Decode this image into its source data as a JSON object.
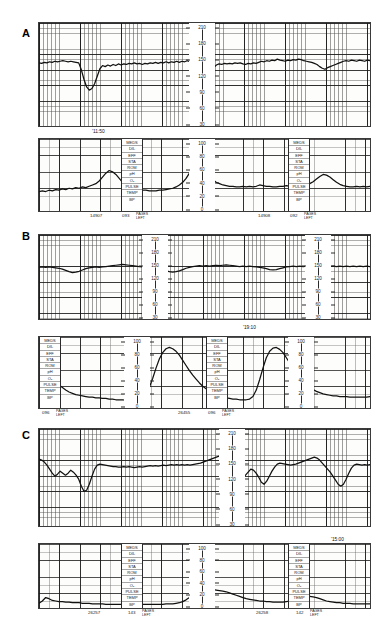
{
  "document": {
    "type": "cardiotocography-strips",
    "panel_count": 3
  },
  "panels": [
    {
      "letter": "A",
      "timestamp": "'11:50",
      "fhr": {
        "ylabel": "FHR (bpm)",
        "ticks": [
          "210",
          "180",
          "150",
          "120",
          "90",
          "60",
          "30"
        ],
        "ymin": 30,
        "ymax": 210
      },
      "toco": {
        "ylabel": "UA (mmHg)",
        "ticks": [
          "100",
          "80",
          "60",
          "40",
          "20",
          "0"
        ],
        "ymin": 0,
        "ymax": 100,
        "annotations": [
          "MEDS",
          "DIL",
          "EFF",
          "STA",
          "ROM",
          "pH",
          "O₂",
          "PULSE",
          "TEMP",
          "BP"
        ]
      },
      "footers": [
        {
          "id": "14907",
          "count": "093",
          "pages": "PAGES",
          "left": "LEFT"
        },
        {
          "id": "14908",
          "count": "092",
          "pages": "PAGES",
          "left": "LEFT"
        }
      ]
    },
    {
      "letter": "B",
      "timestamp": "'19:10",
      "fhr": {
        "ylabel": "FHR (bpm)",
        "ticks": [
          "210",
          "180",
          "150",
          "120",
          "90",
          "60",
          "30"
        ],
        "ymin": 30,
        "ymax": 210
      },
      "toco": {
        "ylabel": "UA (mmHg)",
        "ticks": [
          "100",
          "80",
          "60",
          "40",
          "20",
          "0"
        ],
        "ymin": 0,
        "ymax": 100,
        "annotations": [
          "MEDS",
          "DIL",
          "EFF",
          "STA",
          "ROM",
          "pH",
          "O₂",
          "PULSE",
          "TEMP",
          "BP"
        ]
      },
      "footers": [
        {
          "id": "26455",
          "count": "096",
          "pages": "PAGES",
          "left": "LEFT"
        },
        {
          "id": "",
          "count": "096",
          "pages": "PAGES",
          "left": "LEFT"
        }
      ]
    },
    {
      "letter": "C",
      "timestamp": "'15:00",
      "fhr": {
        "ylabel": "FHR (bpm)",
        "ticks": [
          "210",
          "180",
          "150",
          "120",
          "90",
          "60",
          "30"
        ],
        "ymin": 30,
        "ymax": 210
      },
      "toco": {
        "ylabel": "UA (mmHg)",
        "ticks": [
          "100",
          "80",
          "60",
          "40",
          "20",
          "0"
        ],
        "ymin": 0,
        "ymax": 100,
        "annotations": [
          "MEDS",
          "DIL",
          "EFF",
          "STA",
          "ROM",
          "pH",
          "O₂",
          "PULSE",
          "TEMP",
          "BP"
        ]
      },
      "footers": [
        {
          "id": "26257",
          "count": "143",
          "pages": "PAGES",
          "left": "LEFT"
        },
        {
          "id": "26258",
          "count": "142",
          "pages": "PAGES",
          "left": "LEFT"
        }
      ]
    }
  ],
  "chart_data": [
    {
      "type": "line",
      "title": "Panel A - Fetal Heart Rate",
      "xlabel": "time",
      "ylabel": "bpm",
      "ylim": [
        30,
        210
      ],
      "grid": true,
      "annotations": [
        "'11:50"
      ],
      "series": [
        {
          "name": "FHR",
          "values": [
            143,
            142,
            144,
            143,
            145,
            144,
            146,
            145,
            146,
            147,
            146,
            145,
            146,
            145,
            144,
            143,
            130,
            112,
            98,
            92,
            95,
            104,
            118,
            132,
            138,
            136,
            139,
            137,
            140,
            138,
            141,
            139,
            141,
            140,
            142,
            141,
            143,
            141,
            142,
            140,
            142,
            141,
            143,
            142,
            144,
            142,
            144,
            143,
            145,
            143,
            145,
            144,
            146,
            144,
            146,
            145,
            147,
            145,
            146,
            144,
            140,
            126,
            114,
            112,
            118,
            126,
            134,
            139,
            141,
            140,
            142,
            141,
            142,
            141,
            143,
            142,
            143,
            141,
            140,
            142,
            141,
            143,
            142,
            144,
            146,
            145,
            147,
            146,
            148,
            147,
            150,
            148,
            147,
            146,
            148,
            147,
            149,
            148,
            150,
            149,
            147,
            146,
            145,
            144,
            142,
            140,
            136,
            133,
            131,
            134,
            136,
            138,
            140,
            142,
            144,
            146,
            147,
            146,
            148,
            147,
            146,
            148,
            147,
            146,
            148,
            147
          ]
        }
      ]
    },
    {
      "type": "line",
      "title": "Panel A - Uterine Activity",
      "xlabel": "time",
      "ylabel": "mmHg",
      "ylim": [
        0,
        100
      ],
      "grid": true,
      "series": [
        {
          "name": "UA",
          "values": [
            26,
            27,
            26,
            28,
            27,
            29,
            28,
            30,
            29,
            31,
            30,
            32,
            31,
            33,
            32,
            34,
            36,
            38,
            42,
            48,
            54,
            58,
            56,
            52,
            46,
            40,
            36,
            33,
            31,
            30,
            29,
            28,
            28,
            27,
            27,
            27,
            28,
            28,
            29,
            30,
            31,
            33,
            36,
            40,
            46,
            54,
            62,
            58,
            54,
            52,
            50,
            48,
            44,
            40,
            38,
            36,
            35,
            34,
            34,
            33,
            33,
            34,
            33,
            34,
            33,
            34,
            36,
            35,
            34,
            34,
            33,
            33,
            34,
            34,
            35,
            34,
            34,
            35,
            34,
            35,
            36,
            38,
            41,
            45,
            49,
            52,
            51,
            48,
            44,
            40,
            37,
            35,
            34,
            33,
            33,
            34,
            33,
            34,
            33,
            34
          ]
        }
      ]
    },
    {
      "type": "line",
      "title": "Panel B - Fetal Heart Rate",
      "xlabel": "time",
      "ylabel": "bpm",
      "ylim": [
        30,
        210
      ],
      "grid": true,
      "annotations": [
        "'19:10"
      ],
      "series": [
        {
          "name": "FHR",
          "values": [
            144,
            145,
            144,
            145,
            144,
            143,
            142,
            140,
            137,
            134,
            132,
            133,
            135,
            138,
            141,
            143,
            144,
            145,
            144,
            145,
            146,
            147,
            148,
            149,
            150,
            151,
            150,
            149,
            148,
            147,
            146,
            145,
            144,
            143,
            142,
            141,
            140,
            138,
            136,
            134,
            133,
            134,
            136,
            139,
            142,
            144,
            146,
            147,
            148,
            147,
            148,
            147,
            148,
            149,
            148,
            149,
            150,
            149,
            148,
            147,
            146,
            147,
            146,
            147,
            146,
            145,
            144,
            143,
            141,
            139,
            138,
            139,
            141,
            143,
            145,
            146,
            147,
            146,
            147,
            146,
            147,
            146,
            147,
            146,
            147,
            146,
            147,
            146,
            147,
            146,
            147,
            146,
            147,
            146,
            147,
            146,
            147,
            146,
            147,
            146
          ]
        }
      ]
    },
    {
      "type": "line",
      "title": "Panel B - Uterine Activity",
      "xlabel": "time",
      "ylabel": "mmHg",
      "ylim": [
        0,
        100
      ],
      "grid": true,
      "series": [
        {
          "name": "UA",
          "values": [
            72,
            66,
            58,
            50,
            43,
            37,
            32,
            28,
            24,
            21,
            19,
            17,
            16,
            15,
            14,
            13,
            13,
            12,
            12,
            11,
            11,
            10,
            10,
            9,
            9,
            9,
            8,
            8,
            8,
            8,
            9,
            12,
            18,
            28,
            42,
            58,
            72,
            82,
            88,
            90,
            88,
            84,
            78,
            70,
            62,
            54,
            47,
            41,
            35,
            30,
            26,
            22,
            19,
            17,
            15,
            13,
            12,
            11,
            10,
            10,
            9,
            9,
            9,
            10,
            14,
            24,
            40,
            58,
            74,
            84,
            89,
            90,
            87,
            82,
            74,
            66,
            58,
            50,
            43,
            37,
            32,
            28,
            25,
            22,
            20,
            18,
            17,
            16,
            15,
            15,
            14,
            14,
            14,
            13,
            13,
            13,
            13,
            13,
            13,
            14
          ]
        }
      ]
    },
    {
      "type": "line",
      "title": "Panel C - Fetal Heart Rate",
      "xlabel": "time",
      "ylabel": "bpm",
      "ylim": [
        30,
        210
      ],
      "grid": true,
      "annotations": [
        "'15:00"
      ],
      "series": [
        {
          "name": "FHR",
          "values": [
            158,
            156,
            152,
            146,
            138,
            130,
            124,
            128,
            134,
            130,
            126,
            130,
            136,
            132,
            126,
            118,
            104,
            94,
            96,
            108,
            124,
            138,
            146,
            148,
            147,
            146,
            145,
            144,
            143,
            143,
            142,
            142,
            143,
            142,
            143,
            142,
            141,
            142,
            143,
            142,
            143,
            144,
            145,
            144,
            145,
            144,
            145,
            146,
            145,
            146,
            147,
            146,
            147,
            146,
            147,
            146,
            147,
            146,
            147,
            148,
            149,
            150,
            152,
            154,
            156,
            158,
            160,
            162,
            164,
            166,
            165,
            163,
            158,
            150,
            140,
            130,
            124,
            122,
            126,
            132,
            138,
            136,
            130,
            122,
            112,
            108,
            114,
            124,
            134,
            142,
            148,
            150,
            149,
            148,
            147,
            146,
            147,
            148,
            150,
            152,
            154,
            156,
            158,
            160,
            162,
            160,
            156,
            150,
            144,
            138,
            132,
            124,
            116,
            108,
            104,
            108,
            118,
            130,
            140,
            146,
            148,
            147,
            146,
            147,
            146,
            147
          ]
        }
      ]
    },
    {
      "type": "line",
      "title": "Panel C - Uterine Activity",
      "xlabel": "time",
      "ylabel": "mmHg",
      "ylim": [
        0,
        100
      ],
      "grid": true,
      "series": [
        {
          "name": "UA",
          "values": [
            4,
            8,
            14,
            12,
            9,
            8,
            7,
            7,
            6,
            6,
            5,
            5,
            5,
            4,
            4,
            4,
            3,
            3,
            3,
            3,
            2,
            2,
            2,
            2,
            2,
            2,
            2,
            2,
            2,
            2,
            2,
            2,
            2,
            2,
            2,
            2,
            2,
            2,
            3,
            3,
            3,
            4,
            5,
            7,
            10,
            14,
            19,
            24,
            28,
            30,
            42,
            30,
            28,
            27,
            26,
            25,
            24,
            22,
            20,
            18,
            16,
            14,
            12,
            11,
            10,
            9,
            8,
            8,
            7,
            7,
            6,
            6,
            6,
            6,
            7,
            8,
            10,
            12,
            14,
            15,
            16,
            16,
            15,
            14,
            12,
            10,
            8,
            7,
            6,
            5,
            5,
            4,
            4,
            4,
            3,
            3,
            3,
            3,
            3,
            3
          ]
        }
      ]
    }
  ]
}
